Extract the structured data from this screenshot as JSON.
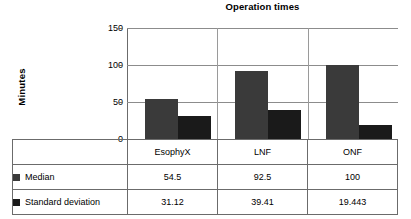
{
  "chart_data": {
    "type": "bar",
    "title": "Operation times",
    "xlabel": "",
    "ylabel": "Minutes",
    "categories": [
      "EsophyX",
      "LNF",
      "ONF"
    ],
    "series": [
      {
        "name": "Median",
        "values": [
          54.5,
          92.5,
          100
        ]
      },
      {
        "name": "Standard deviation",
        "values": [
          31.12,
          39.41,
          19.443
        ]
      }
    ],
    "ylim": [
      0,
      150
    ],
    "yticks": [
      0,
      50,
      100,
      150
    ],
    "ytick_labels": [
      "0",
      "50",
      "100",
      "150"
    ],
    "grid": true,
    "legend_position": "table-row-headers",
    "colors": {
      "median": "#3a3a3a",
      "stddev": "#1a1a1a",
      "gridline": "#8c8c8c",
      "axis": "#6b6b6b",
      "background": "#ffffff",
      "text": "#000000"
    }
  },
  "table": {
    "corner_label": "",
    "column_headers": [
      "EsophyX",
      "LNF",
      "ONF"
    ],
    "rows": [
      {
        "label": "Median",
        "cells": [
          "54.5",
          "92.5",
          "100"
        ]
      },
      {
        "label": "Standard deviation",
        "cells": [
          "31.12",
          "39.41",
          "19.443"
        ]
      }
    ]
  }
}
